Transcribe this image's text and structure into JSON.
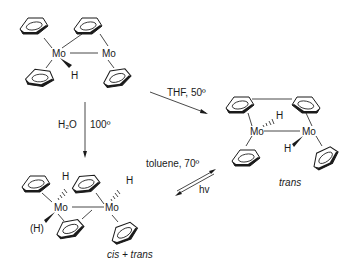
{
  "diagram": {
    "type": "reaction-scheme",
    "compounds": [
      {
        "id": "start",
        "atoms": {
          "metal_1": "Mo",
          "metal_2": "Mo",
          "hydride": "H"
        }
      },
      {
        "id": "product_trans",
        "atoms": {
          "metal_1": "Mo",
          "metal_2": "Mo",
          "hydride_1": "H",
          "hydride_2": "H"
        },
        "caption": "trans"
      },
      {
        "id": "product_cis_trans",
        "atoms": {
          "metal_1": "Mo",
          "metal_2": "Mo",
          "hydride_1": "H",
          "hydride_2": "H",
          "hydride_alt": "(H)"
        },
        "caption": "cis + trans"
      }
    ],
    "arrows": [
      {
        "id": "thf",
        "conditions": "THF, 50º"
      },
      {
        "id": "water",
        "reagent": "H₂O",
        "temperature": "100º"
      },
      {
        "id": "toluene",
        "forward": "toluene, 70º",
        "reverse": "hv"
      }
    ],
    "colors": {
      "line": "#1a1a1a",
      "background": "#ffffff"
    }
  }
}
